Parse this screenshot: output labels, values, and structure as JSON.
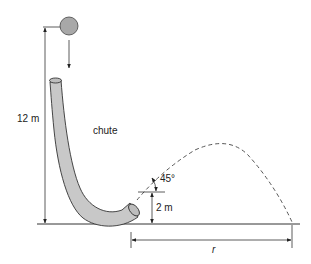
{
  "figure": {
    "labels": {
      "height": "12 m",
      "chute": "chute",
      "angle": "45°",
      "exit_height": "2 m",
      "range": "r"
    },
    "colors": {
      "chute_fill": "#c8c8c8",
      "ball_fill": "#a8a8a8",
      "line": "#222222"
    }
  }
}
